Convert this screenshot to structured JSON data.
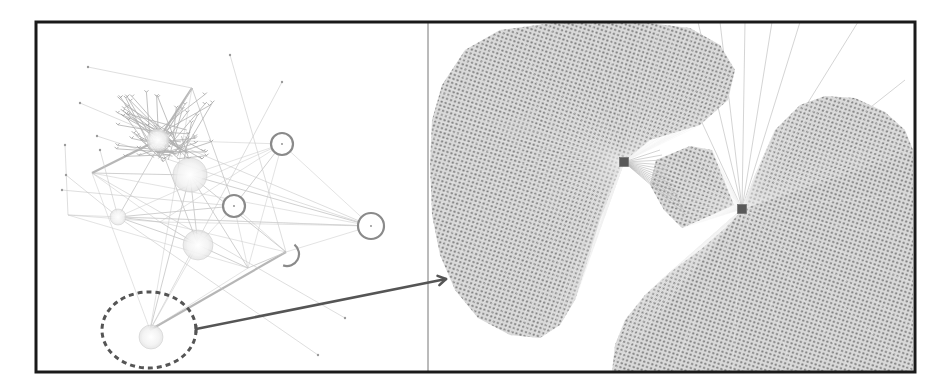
{
  "figure": {
    "width": 943,
    "height": 392,
    "frame": {
      "x": 36,
      "y": 22,
      "w": 879,
      "h": 350,
      "stroke": "#1a1a1a",
      "stroke_width": 3
    },
    "divider": {
      "x": 428,
      "color": "#777777"
    },
    "colors": {
      "background": "#ffffff",
      "edge_light": "#c8c8c8",
      "edge_mid": "#a9a9a9",
      "node_ring": "#8a8a8a",
      "dot": "#8c8c8c",
      "fan_fill": "#cfcfcf",
      "hub": "#595959",
      "arrow": "#555555",
      "dashed_circle": "#555555"
    }
  },
  "overview_panel": {
    "label": "full network overview",
    "ring_nodes": [
      {
        "cx": 282,
        "cy": 144,
        "r": 11
      },
      {
        "cx": 234,
        "cy": 206,
        "r": 11
      },
      {
        "cx": 371,
        "cy": 226,
        "r": 13
      }
    ],
    "partial_arc": {
      "cx": 287,
      "cy": 254,
      "r": 12
    },
    "soft_clusters": [
      {
        "cx": 190,
        "cy": 175,
        "r": 17
      },
      {
        "cx": 158,
        "cy": 140,
        "r": 11
      },
      {
        "cx": 198,
        "cy": 245,
        "r": 15
      },
      {
        "cx": 118,
        "cy": 217,
        "r": 8
      },
      {
        "cx": 151,
        "cy": 337,
        "r": 12
      }
    ],
    "hub_points": [
      [
        282,
        144
      ],
      [
        234,
        206
      ],
      [
        371,
        226
      ],
      [
        190,
        175
      ],
      [
        158,
        140
      ],
      [
        198,
        245
      ],
      [
        118,
        217
      ],
      [
        286,
        252
      ],
      [
        160,
        222
      ],
      [
        68,
        215
      ],
      [
        150,
        330
      ],
      [
        248,
        268
      ],
      [
        192,
        88
      ],
      [
        92,
        173
      ]
    ],
    "dashed_selection": {
      "cx": 149,
      "cy": 330,
      "rx": 47,
      "ry": 38
    }
  },
  "zoom_arrow": {
    "x1": 196,
    "y1": 329,
    "x2": 446,
    "y2": 279
  },
  "detail_panel": {
    "label": "zoomed detail of selected region",
    "hubs": [
      {
        "id": "hub-a",
        "x": 624,
        "y": 162,
        "size": 9
      },
      {
        "id": "hub-b",
        "x": 742,
        "y": 209,
        "size": 9
      }
    ],
    "fans": [
      {
        "id": "fan-a",
        "hub": "hub-a",
        "outline": [
          [
            624,
            162
          ],
          [
            650,
            140
          ],
          [
            700,
            125
          ],
          [
            728,
            100
          ],
          [
            735,
            70
          ],
          [
            720,
            45
          ],
          [
            690,
            28
          ],
          [
            640,
            22
          ],
          [
            560,
            22
          ],
          [
            500,
            30
          ],
          [
            465,
            50
          ],
          [
            442,
            85
          ],
          [
            432,
            120
          ],
          [
            430,
            165
          ],
          [
            432,
            215
          ],
          [
            440,
            255
          ],
          [
            455,
            290
          ],
          [
            478,
            318
          ],
          [
            510,
            335
          ],
          [
            540,
            338
          ],
          [
            560,
            325
          ],
          [
            575,
            300
          ],
          [
            588,
            260
          ],
          [
            600,
            220
          ],
          [
            612,
            190
          ]
        ]
      },
      {
        "id": "fan-b",
        "hub": "hub-b",
        "outline": [
          [
            742,
            209
          ],
          [
            755,
            175
          ],
          [
            775,
            130
          ],
          [
            800,
            105
          ],
          [
            825,
            96
          ],
          [
            855,
            98
          ],
          [
            885,
            112
          ],
          [
            905,
            130
          ],
          [
            913,
            150
          ],
          [
            913,
            372
          ],
          [
            612,
            372
          ],
          [
            615,
            345
          ],
          [
            625,
            320
          ],
          [
            645,
            295
          ],
          [
            670,
            272
          ],
          [
            700,
            250
          ],
          [
            725,
            228
          ]
        ]
      },
      {
        "id": "fan-c",
        "hub": "hub-b",
        "outline": [
          [
            656,
            160
          ],
          [
            690,
            146
          ],
          [
            712,
            150
          ],
          [
            722,
            175
          ],
          [
            734,
            205
          ],
          [
            712,
            215
          ],
          [
            682,
            228
          ],
          [
            664,
            210
          ],
          [
            650,
            185
          ]
        ]
      }
    ],
    "upper_edges": [
      [
        742,
        209,
        720,
        22
      ],
      [
        742,
        209,
        745,
        22
      ],
      [
        742,
        209,
        772,
        22
      ],
      [
        742,
        209,
        800,
        22
      ],
      [
        742,
        209,
        858,
        22
      ],
      [
        742,
        209,
        698,
        22
      ],
      [
        742,
        209,
        680,
        75
      ],
      [
        742,
        209,
        905,
        80
      ]
    ],
    "bridge_edges_to": "hub-a"
  }
}
